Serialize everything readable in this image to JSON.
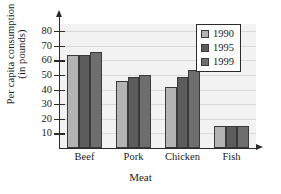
{
  "chart_data": {
    "type": "bar",
    "title": "",
    "categories": [
      "Beef",
      "Pork",
      "Chicken",
      "Fish"
    ],
    "series": [
      {
        "name": "1990",
        "values": [
          63.5,
          46.0,
          42.0,
          15.0
        ],
        "color": "#b3b3b3"
      },
      {
        "name": "1995",
        "values": [
          64.0,
          48.5,
          48.5,
          15.0
        ],
        "color": "#5c5c5c"
      },
      {
        "name": "1999",
        "values": [
          65.5,
          50.0,
          53.5,
          15.0
        ],
        "color": "#6e6e6e"
      }
    ],
    "xlabel": "Meat",
    "ylabel_line1": "Per capita consumption",
    "ylabel_line2": "(in pounds)",
    "yticks": [
      10,
      20,
      30,
      40,
      50,
      60,
      70,
      80
    ],
    "ylim": [
      0,
      85
    ],
    "grid": true,
    "legend_position": "top-right",
    "legend_entries": [
      "1990",
      "1995",
      "1999"
    ],
    "plot_background": "#f2f2f2",
    "axis_color": "#2b2b2b"
  }
}
